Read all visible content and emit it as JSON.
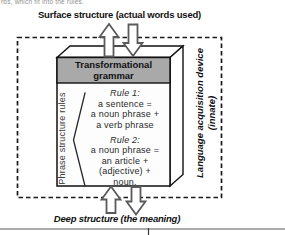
{
  "page": {
    "top_fragment": "rbs, which fit into the rules.",
    "surface_label": "Surface structure (actual words used)",
    "deep_label": "Deep structure (the meaning)"
  },
  "device": {
    "name_line1": "Language acquisition device",
    "name_line2": "(innate)"
  },
  "box": {
    "header": "Transformational grammar",
    "side_label": "Phrase structure rules",
    "rules": [
      {
        "title": "Rule 1:",
        "lines": [
          "a sentence =",
          "a noun phrase +",
          "a verb phrase"
        ]
      },
      {
        "title": "Rule 2:",
        "lines": [
          "a noun phrase =",
          "an article +",
          "(adjective) +",
          "noun."
        ]
      }
    ]
  },
  "icons": {
    "top_up_arrow": "up-arrow",
    "top_down_arrow": "down-arrow",
    "bottom_up_arrow": "up-arrow",
    "bottom_down_arrow": "down-arrow"
  },
  "colors": {
    "header_fill": "#a9a9a9",
    "outline": "#1a1a1a",
    "arrow_outline": "#5a5a5a",
    "bottom_rule": "#8f8f8f"
  }
}
